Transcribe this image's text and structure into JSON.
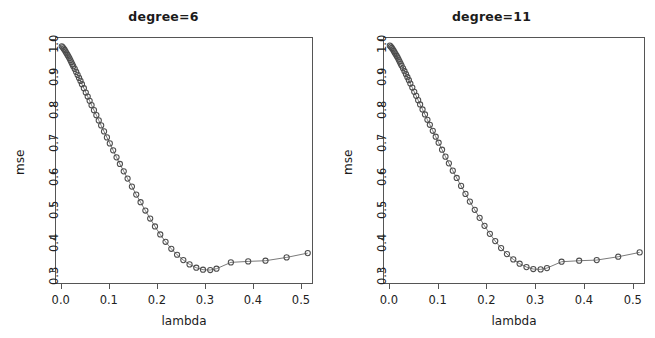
{
  "figure": {
    "background": "#ffffff",
    "point_color": "#4d4d4d",
    "line_color": "#6b6b6b",
    "axis_color": "#555555"
  },
  "panels": [
    {
      "title": "degree=6",
      "xlabel": "lambda",
      "ylabel": "mse",
      "xticks": [
        "0.0",
        "0.1",
        "0.2",
        "0.3",
        "0.4",
        "0.5"
      ],
      "yticks": [
        "1.0",
        "0.9",
        "0.8",
        "0.7",
        "0.6",
        "0.5",
        "0.4",
        "0.3"
      ]
    },
    {
      "title": "degree=11",
      "xlabel": "lambda",
      "ylabel": "mse",
      "xticks": [
        "0.0",
        "0.1",
        "0.2",
        "0.3",
        "0.4",
        "0.5"
      ],
      "yticks": [
        "1.0",
        "0.9",
        "0.8",
        "0.7",
        "0.6",
        "0.5",
        "0.4",
        "0.3"
      ]
    }
  ],
  "chart_data": [
    {
      "type": "line",
      "title": "degree=6",
      "xlabel": "lambda",
      "ylabel": "mse",
      "xlim": [
        -0.012,
        0.525
      ],
      "ylim": [
        0.262,
        1.005
      ],
      "xticks": [
        0.0,
        0.1,
        0.2,
        0.3,
        0.4,
        0.5
      ],
      "yticks": [
        0.3,
        0.4,
        0.5,
        0.6,
        0.7,
        0.8,
        0.9,
        1.0
      ],
      "grid": false,
      "legend": "none",
      "marker": "open-circle",
      "x": [
        0.0,
        0.002,
        0.004,
        0.006,
        0.008,
        0.01,
        0.012,
        0.014,
        0.016,
        0.018,
        0.02,
        0.022,
        0.024,
        0.027,
        0.03,
        0.033,
        0.036,
        0.039,
        0.042,
        0.046,
        0.05,
        0.054,
        0.058,
        0.062,
        0.067,
        0.072,
        0.077,
        0.082,
        0.088,
        0.094,
        0.1,
        0.107,
        0.114,
        0.121,
        0.129,
        0.137,
        0.146,
        0.155,
        0.164,
        0.174,
        0.184,
        0.194,
        0.205,
        0.216,
        0.228,
        0.24,
        0.253,
        0.266,
        0.28,
        0.294,
        0.309,
        0.322,
        0.352,
        0.388,
        0.424,
        0.468,
        0.512
      ],
      "y": [
        0.98,
        0.977,
        0.973,
        0.969,
        0.964,
        0.959,
        0.954,
        0.949,
        0.944,
        0.938,
        0.932,
        0.926,
        0.92,
        0.912,
        0.903,
        0.894,
        0.885,
        0.876,
        0.866,
        0.854,
        0.841,
        0.829,
        0.816,
        0.803,
        0.788,
        0.773,
        0.757,
        0.742,
        0.724,
        0.706,
        0.688,
        0.667,
        0.646,
        0.626,
        0.604,
        0.582,
        0.558,
        0.534,
        0.511,
        0.486,
        0.462,
        0.438,
        0.414,
        0.392,
        0.371,
        0.353,
        0.337,
        0.324,
        0.314,
        0.308,
        0.307,
        0.311,
        0.33,
        0.333,
        0.335,
        0.345,
        0.358
      ],
      "annotations": [
        {
          "text": "minimum mse",
          "x": 0.294,
          "y": 0.308
        }
      ]
    },
    {
      "type": "line",
      "title": "degree=11",
      "xlabel": "lambda",
      "ylabel": "mse",
      "xlim": [
        -0.012,
        0.525
      ],
      "ylim": [
        0.262,
        1.005
      ],
      "xticks": [
        0.0,
        0.1,
        0.2,
        0.3,
        0.4,
        0.5
      ],
      "yticks": [
        0.3,
        0.4,
        0.5,
        0.6,
        0.7,
        0.8,
        0.9,
        1.0
      ],
      "grid": false,
      "legend": "none",
      "marker": "open-circle",
      "x": [
        0.0,
        0.002,
        0.004,
        0.006,
        0.008,
        0.01,
        0.012,
        0.014,
        0.016,
        0.018,
        0.02,
        0.022,
        0.024,
        0.027,
        0.03,
        0.033,
        0.036,
        0.039,
        0.042,
        0.046,
        0.05,
        0.054,
        0.058,
        0.062,
        0.067,
        0.072,
        0.077,
        0.082,
        0.088,
        0.094,
        0.1,
        0.107,
        0.114,
        0.121,
        0.129,
        0.137,
        0.146,
        0.155,
        0.164,
        0.174,
        0.184,
        0.194,
        0.205,
        0.216,
        0.228,
        0.24,
        0.253,
        0.266,
        0.28,
        0.294,
        0.309,
        0.322,
        0.352,
        0.388,
        0.424,
        0.468,
        0.512
      ],
      "y": [
        0.982,
        0.979,
        0.975,
        0.971,
        0.966,
        0.961,
        0.956,
        0.951,
        0.946,
        0.94,
        0.934,
        0.928,
        0.922,
        0.914,
        0.905,
        0.896,
        0.887,
        0.878,
        0.868,
        0.856,
        0.843,
        0.831,
        0.818,
        0.805,
        0.79,
        0.775,
        0.759,
        0.744,
        0.726,
        0.708,
        0.69,
        0.669,
        0.648,
        0.628,
        0.606,
        0.584,
        0.56,
        0.536,
        0.513,
        0.488,
        0.464,
        0.44,
        0.416,
        0.394,
        0.373,
        0.355,
        0.339,
        0.326,
        0.316,
        0.31,
        0.309,
        0.313,
        0.332,
        0.335,
        0.337,
        0.347,
        0.36
      ],
      "annotations": [
        {
          "text": "minimum mse",
          "x": 0.309,
          "y": 0.309
        }
      ]
    }
  ]
}
